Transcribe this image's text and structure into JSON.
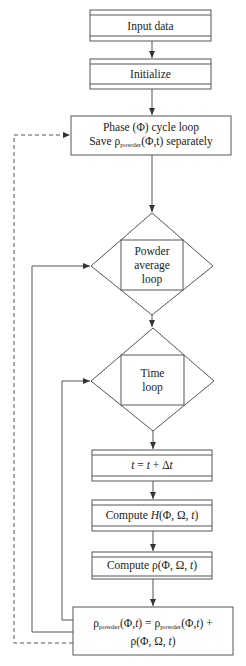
{
  "diagram": {
    "type": "flowchart",
    "nodes": [
      {
        "id": "input",
        "shape": "process-predefined",
        "label": "Input data"
      },
      {
        "id": "init",
        "shape": "process-predefined",
        "label": "Initialize"
      },
      {
        "id": "phase",
        "shape": "rectangle",
        "line1": "Phase (Φ) cycle loop",
        "line2_pre": "Save ρ",
        "line2_sub": "powder",
        "line2_post": "(Φ,t) separately"
      },
      {
        "id": "powder",
        "shape": "loop-diamond",
        "lines": [
          "Powder",
          "average",
          "loop"
        ]
      },
      {
        "id": "time",
        "shape": "loop-diamond",
        "lines": [
          "Time",
          "loop"
        ]
      },
      {
        "id": "step",
        "shape": "process-predefined",
        "label_pre": "t",
        "label_mid": " = ",
        "label_t2": "t",
        "label_post": " + Δ",
        "label_t3": "t"
      },
      {
        "id": "computeH",
        "shape": "process-predefined",
        "label_pre": "Compute ",
        "label_fn": "H",
        "label_args": "(Φ, Ω, ",
        "label_t": "t",
        "label_close": ")"
      },
      {
        "id": "computeRho",
        "shape": "process-predefined",
        "label_pre": "Compute ρ(Φ, Ω, ",
        "label_t": "t",
        "label_close": ")"
      },
      {
        "id": "accumulate",
        "shape": "rectangle",
        "line1_a": "ρ",
        "line1_sub1": "powder",
        "line1_b": "(Φ,",
        "line1_t1": "t",
        "line1_c": ") = ρ",
        "line1_sub2": "powder",
        "line1_d": "(Φ,",
        "line1_t2": "t",
        "line1_e": ") +",
        "line2_a": "ρ(Φ, Ω, ",
        "line2_t": "t",
        "line2_b": ")"
      }
    ],
    "edges": [
      {
        "from": "input",
        "to": "init",
        "style": "solid"
      },
      {
        "from": "init",
        "to": "phase",
        "style": "solid"
      },
      {
        "from": "phase",
        "to": "powder",
        "style": "solid"
      },
      {
        "from": "powder",
        "to": "time",
        "style": "solid"
      },
      {
        "from": "time",
        "to": "step",
        "style": "solid"
      },
      {
        "from": "step",
        "to": "computeH",
        "style": "solid"
      },
      {
        "from": "computeH",
        "to": "computeRho",
        "style": "solid"
      },
      {
        "from": "computeRho",
        "to": "accumulate",
        "style": "solid"
      },
      {
        "from": "accumulate",
        "to": "time",
        "style": "solid",
        "note": "inner loop back"
      },
      {
        "from": "accumulate",
        "to": "powder",
        "style": "solid",
        "note": "outer loop back"
      },
      {
        "from": "accumulate",
        "to": "phase",
        "style": "dashed",
        "note": "phase loop back"
      }
    ],
    "colors": {
      "line": "#555555",
      "text": "#222222",
      "background": "#ffffff"
    }
  }
}
